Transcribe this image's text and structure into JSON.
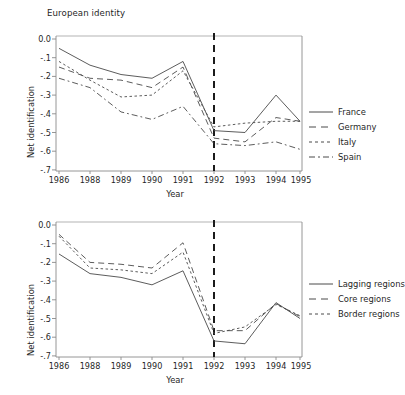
{
  "figure": {
    "background": "#ffffff",
    "line_color": "#4a4a4a",
    "axis_color": "#8a8a8a",
    "event_line_color": "#1b1b1b"
  },
  "panels": [
    {
      "id": "top",
      "title": "European identity",
      "xlabel": "Year",
      "ylabel": "Net identification",
      "yticks": [
        "0.0",
        "-.1",
        "-.2",
        "-.3",
        "-.4",
        "-.5",
        "-.6",
        "-.7"
      ],
      "xticks": [
        "1986",
        "1988",
        "1989",
        "1990",
        "1991",
        "1992",
        "1993",
        "1994",
        "1995"
      ],
      "legend": [
        {
          "label": "France",
          "dash": "none"
        },
        {
          "label": "Germany",
          "dash": "dashed"
        },
        {
          "label": "Italy",
          "dash": "dotted"
        },
        {
          "label": "Spain",
          "dash": "dashdot"
        }
      ]
    },
    {
      "id": "bottom",
      "title": "",
      "xlabel": "Year",
      "ylabel": "Net identification",
      "yticks": [
        "0.0",
        "-.1",
        "-.2",
        "-.3",
        "-.4",
        "-.5",
        "-.6",
        "-.7"
      ],
      "xticks": [
        "1986",
        "1988",
        "1989",
        "1990",
        "1991",
        "1992",
        "1993",
        "1994",
        "1995"
      ],
      "legend": [
        {
          "label": "Lagging regions",
          "dash": "none"
        },
        {
          "label": "Core regions",
          "dash": "dashed"
        },
        {
          "label": "Border regions",
          "dash": "dotted"
        }
      ]
    }
  ],
  "chart_data": [
    {
      "type": "line",
      "title": "European identity",
      "xlabel": "Year",
      "ylabel": "Net identification",
      "categories": [
        "1986",
        "1988",
        "1989",
        "1990",
        "1991",
        "1992",
        "1993",
        "1994",
        "1995"
      ],
      "ylim": [
        -0.7,
        0.0
      ],
      "yticks": [
        0.0,
        -0.1,
        -0.2,
        -0.3,
        -0.4,
        -0.5,
        -0.6,
        -0.7
      ],
      "grid": false,
      "legend_position": "right",
      "annotations": [
        {
          "type": "vline",
          "x": "1992",
          "style": "dashed",
          "label": ""
        }
      ],
      "series": [
        {
          "name": "France",
          "dash": "none",
          "values": [
            -0.05,
            -0.14,
            -0.19,
            -0.21,
            -0.12,
            -0.49,
            -0.5,
            -0.3,
            -0.44
          ]
        },
        {
          "name": "Germany",
          "dash": "dashed",
          "values": [
            -0.15,
            -0.21,
            -0.22,
            -0.26,
            -0.15,
            -0.53,
            -0.55,
            -0.42,
            -0.44
          ]
        },
        {
          "name": "Italy",
          "dash": "dotted",
          "values": [
            -0.12,
            -0.22,
            -0.31,
            -0.3,
            -0.17,
            -0.47,
            -0.45,
            -0.44,
            -0.44
          ]
        },
        {
          "name": "Spain",
          "dash": "dashdot",
          "values": [
            -0.21,
            -0.26,
            -0.39,
            -0.43,
            -0.36,
            -0.56,
            -0.57,
            -0.55,
            -0.59
          ]
        }
      ]
    },
    {
      "type": "line",
      "title": "",
      "xlabel": "Year",
      "ylabel": "Net identification",
      "categories": [
        "1986",
        "1988",
        "1989",
        "1990",
        "1991",
        "1992",
        "1993",
        "1994",
        "1995"
      ],
      "ylim": [
        -0.7,
        0.0
      ],
      "yticks": [
        0.0,
        -0.1,
        -0.2,
        -0.3,
        -0.4,
        -0.5,
        -0.6,
        -0.7
      ],
      "grid": false,
      "legend_position": "right",
      "annotations": [
        {
          "type": "vline",
          "x": "1992",
          "style": "dashed",
          "label": ""
        }
      ],
      "series": [
        {
          "name": "Lagging regions",
          "dash": "none",
          "values": [
            -0.155,
            -0.26,
            -0.28,
            -0.32,
            -0.245,
            -0.62,
            -0.635,
            -0.415,
            -0.5
          ]
        },
        {
          "name": "Core regions",
          "dash": "dashed",
          "values": [
            -0.05,
            -0.2,
            -0.21,
            -0.23,
            -0.095,
            -0.565,
            -0.565,
            -0.42,
            -0.49
          ]
        },
        {
          "name": "Border regions",
          "dash": "dotted",
          "values": [
            -0.06,
            -0.23,
            -0.24,
            -0.26,
            -0.145,
            -0.58,
            -0.545,
            -0.425,
            -0.485
          ]
        }
      ]
    }
  ]
}
